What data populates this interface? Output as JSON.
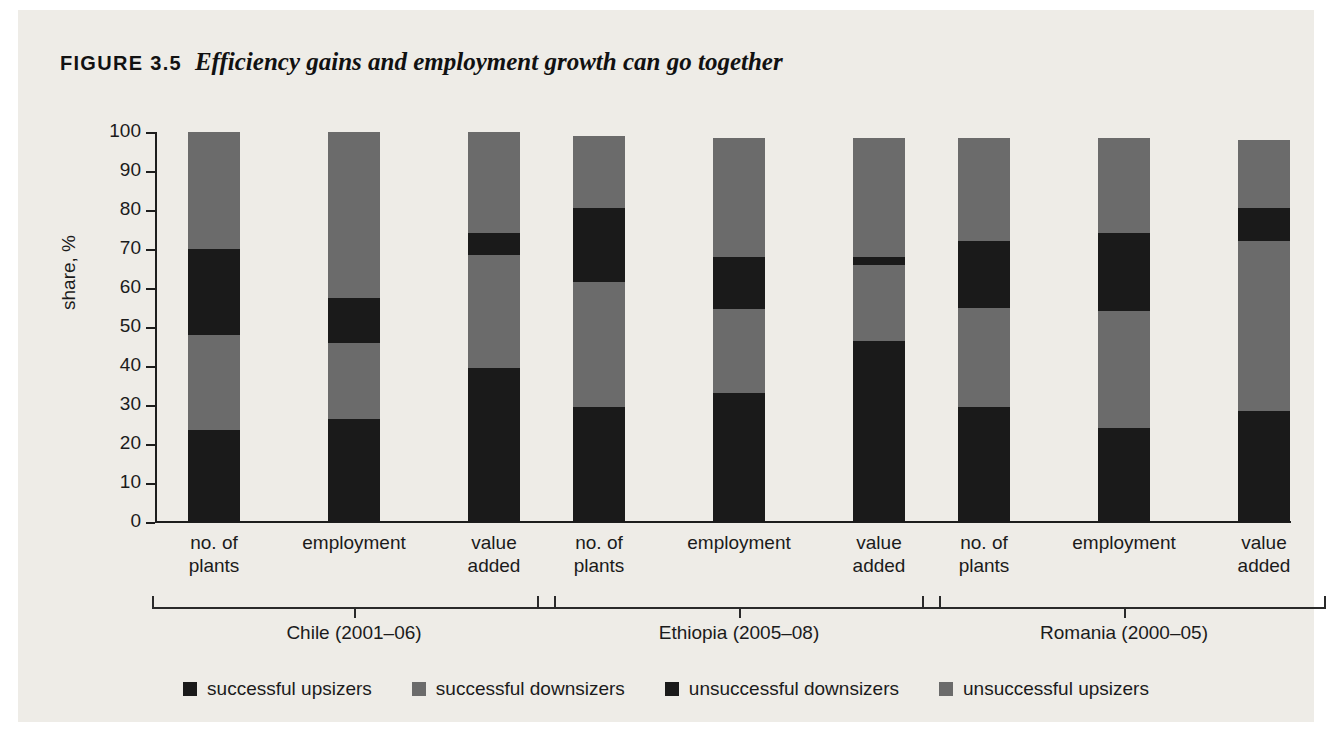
{
  "figure": {
    "label": "FIGURE 3.5",
    "title": "Efficiency gains and employment growth can go together"
  },
  "chart_data": {
    "type": "bar",
    "subtype": "stacked-bar-100",
    "title": "Efficiency gains and employment growth can go together",
    "xlabel": "",
    "ylabel": "share, %",
    "ylim": [
      0,
      100
    ],
    "yticks": [
      0,
      10,
      20,
      30,
      40,
      50,
      60,
      70,
      80,
      90,
      100
    ],
    "ytick_labels": [
      "0",
      "10",
      "20",
      "30",
      "40",
      "50",
      "60",
      "70",
      "80",
      "90",
      "100"
    ],
    "grid": false,
    "legend_position": "bottom",
    "categories": [
      "no. of\nplants",
      "employment",
      "value\nadded",
      "no. of\nplants",
      "employment",
      "value\nadded",
      "no. of\nplants",
      "employment",
      "value\nadded"
    ],
    "groups": [
      {
        "name": "Chile (2001–06)",
        "categories": [
          "no. of plants",
          "employment",
          "value added"
        ]
      },
      {
        "name": "Ethiopia (2005–08)",
        "categories": [
          "no. of plants",
          "employment",
          "value added"
        ]
      },
      {
        "name": "Romania (2000–05)",
        "categories": [
          "no. of plants",
          "employment",
          "value added"
        ]
      }
    ],
    "series": [
      {
        "name": "successful upsizers",
        "color": "#1a1a1a",
        "values": [
          23.5,
          26.5,
          39.5,
          29.5,
          33.0,
          46.5,
          29.5,
          24.0,
          28.5
        ]
      },
      {
        "name": "successful downsizers",
        "color": "#6b6b6b",
        "values": [
          24.5,
          19.5,
          29.0,
          32.0,
          21.5,
          19.5,
          25.5,
          30.0,
          43.5
        ]
      },
      {
        "name": "unsuccessful downsizers",
        "color": "#1a1a1a",
        "values": [
          22.0,
          11.5,
          5.5,
          19.0,
          13.5,
          2.0,
          17.0,
          20.0,
          8.5
        ]
      },
      {
        "name": "unsuccessful upsizers",
        "color": "#6b6b6b",
        "values": [
          30.0,
          42.5,
          26.0,
          18.5,
          30.5,
          30.5,
          26.5,
          24.5,
          17.5
        ]
      }
    ],
    "bar_totals": [
      100.0,
      100.0,
      100.0,
      99.0,
      98.5,
      98.5,
      98.5,
      98.5,
      98.0
    ]
  },
  "legend": [
    {
      "label": "successful upsizers",
      "color": "#1a1a1a"
    },
    {
      "label": "successful downsizers",
      "color": "#6b6b6b"
    },
    {
      "label": "unsuccessful downsizers",
      "color": "#1a1a1a"
    },
    {
      "label": "unsuccessful upsizers",
      "color": "#6b6b6b"
    }
  ]
}
